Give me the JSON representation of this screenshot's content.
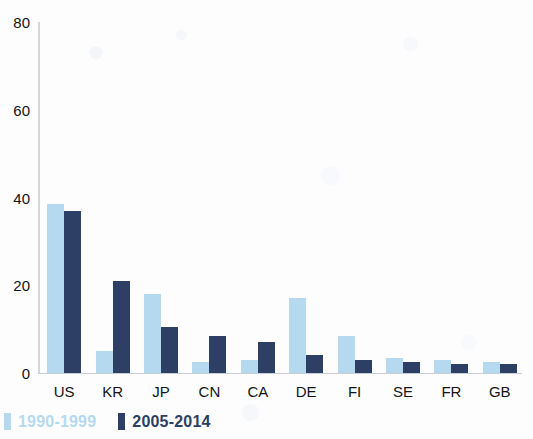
{
  "chart_data": {
    "type": "bar",
    "title": "",
    "subtitle": "",
    "xlabel": "",
    "ylabel": "",
    "ylim": [
      0,
      80
    ],
    "yticks": [
      0,
      20,
      40,
      60,
      80
    ],
    "grid": false,
    "legend_position": "bottom-left",
    "categories": [
      "US",
      "KR",
      "JP",
      "CN",
      "CA",
      "DE",
      "FI",
      "SE",
      "FR",
      "GB"
    ],
    "series": [
      {
        "name": "1990-1999",
        "color": "#b5daef",
        "values": [
          38.5,
          5.0,
          18.0,
          2.5,
          3.0,
          17.0,
          8.5,
          3.5,
          3.0,
          2.5
        ]
      },
      {
        "name": "2005-2014",
        "color": "#2e3f66",
        "values": [
          37.0,
          21.0,
          10.5,
          8.5,
          7.0,
          4.0,
          3.0,
          2.5,
          2.0,
          2.0
        ]
      }
    ]
  },
  "axis": {
    "y_tick_labels": [
      "0",
      "20",
      "40",
      "60",
      "80"
    ]
  },
  "legend": {
    "entries": [
      {
        "label": "1990-1999",
        "color": "#b5daef"
      },
      {
        "label": "2005-2014",
        "color": "#2e3f66"
      }
    ]
  }
}
